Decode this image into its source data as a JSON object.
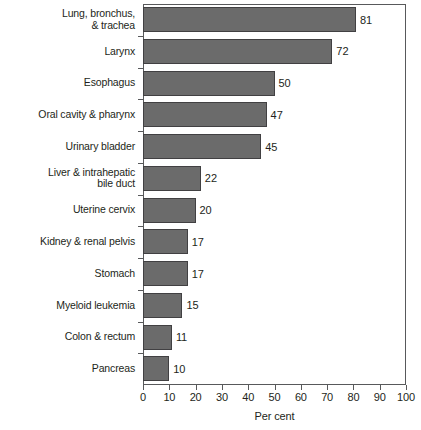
{
  "chart_data": {
    "type": "bar",
    "orientation": "horizontal",
    "title": "",
    "subtitle": "",
    "xlabel": "Per cent",
    "ylabel": "",
    "xlim": [
      0,
      100
    ],
    "xticks": [
      0,
      10,
      20,
      30,
      40,
      50,
      60,
      70,
      80,
      90,
      100
    ],
    "xtick_labels": [
      "0",
      "10",
      "20",
      "30",
      "40",
      "50",
      "60",
      "70",
      "80",
      "90",
      "100"
    ],
    "grid": false,
    "legend": null,
    "legend_position": "none",
    "bar_color": "#6b6b6b",
    "bar_edge_color": "#414042",
    "axis_color": "#58595b",
    "text_color": "#231f20",
    "categories": [
      "Lung, bronchus,\n& trachea",
      "Larynx",
      "Esophagus",
      "Oral cavity & pharynx",
      "Urinary bladder",
      "Liver & intrahepatic\nbile duct",
      "Uterine cervix",
      "Kidney & renal pelvis",
      "Stomach",
      "Myeloid leukemia",
      "Colon & rectum",
      "Pancreas"
    ],
    "values": [
      81,
      72,
      50,
      47,
      45,
      22,
      20,
      17,
      17,
      15,
      11,
      10
    ],
    "value_labels": [
      "81",
      "72",
      "50",
      "47",
      "45",
      "22",
      "20",
      "17",
      "17",
      "15",
      "11",
      "10"
    ]
  }
}
